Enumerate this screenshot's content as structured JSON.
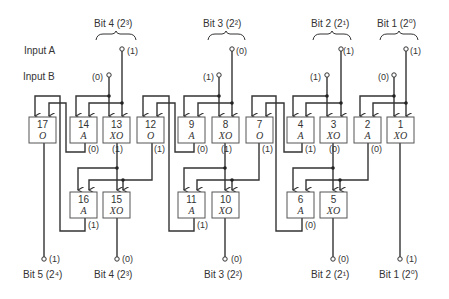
{
  "labels": {
    "input_a": "Input A",
    "input_b": "Input B"
  },
  "input_groups": [
    {
      "label": "Bit 4 (2³)",
      "a_value": "(1)",
      "b_value": "(0)"
    },
    {
      "label": "Bit 3 (2²)",
      "a_value": "(0)",
      "b_value": "(1)"
    },
    {
      "label": "Bit 2 (2¹)",
      "a_value": "(1)",
      "b_value": "(1)"
    },
    {
      "label": "Bit 1 (2⁰)",
      "a_value": "(1)",
      "b_value": "(0)"
    }
  ],
  "gates": {
    "g17": {
      "num": "17",
      "type": "O"
    },
    "g14": {
      "num": "14",
      "type": "A",
      "out": "(0)"
    },
    "g13": {
      "num": "13",
      "type": "XO",
      "out": "(1)"
    },
    "g12": {
      "num": "12",
      "type": "O",
      "out": "(1)"
    },
    "g9": {
      "num": "9",
      "type": "A",
      "out": "(0)"
    },
    "g8": {
      "num": "8",
      "type": "XO",
      "out": "(1)"
    },
    "g7": {
      "num": "7",
      "type": "O",
      "out": "(1)"
    },
    "g4": {
      "num": "4",
      "type": "A",
      "out": "(1)"
    },
    "g3": {
      "num": "3",
      "type": "XO",
      "out": "(0)"
    },
    "g2": {
      "num": "2",
      "type": "A",
      "out": "(0)"
    },
    "g1": {
      "num": "1",
      "type": "XO"
    },
    "g16": {
      "num": "16",
      "type": "A",
      "out": "(1)"
    },
    "g15": {
      "num": "15",
      "type": "XO"
    },
    "g11": {
      "num": "11",
      "type": "A",
      "out": "(1)"
    },
    "g10": {
      "num": "10",
      "type": "XO"
    },
    "g6": {
      "num": "6",
      "type": "A",
      "out": "(0)"
    },
    "g5": {
      "num": "5",
      "type": "XO"
    }
  },
  "outputs": [
    {
      "label": "Bit 5 (2⁴)",
      "value": "(1)"
    },
    {
      "label": "Bit 4 (2³)",
      "value": "(0)"
    },
    {
      "label": "Bit 3 (2²)",
      "value": "(0)"
    },
    {
      "label": "Bit 2 (2¹)",
      "value": "(0)"
    },
    {
      "label": "Bit 1 (2⁰)",
      "value": "(1)"
    }
  ]
}
